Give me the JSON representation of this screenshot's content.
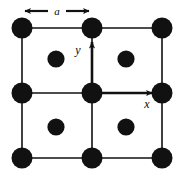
{
  "figure": {
    "name": "square-lattice-unit-cells",
    "background_color": "#ffffff",
    "ink_color": "#111111",
    "atom_color": "#111111"
  },
  "labels": {
    "lattice_constant": "a",
    "x_axis": "x",
    "y_axis": "y"
  },
  "diagram_data": {
    "type": "lattice-diagram",
    "description": "Two-dimensional square lattice drawn as a 2x2 array of unit cells, with large lattice-point atoms at every cell corner and smaller atoms at every cell center; Cartesian x and y axes originate at the central lattice point.",
    "lattice_constant_label": "a",
    "grid_columns": 3,
    "grid_rows": 3,
    "cell_size_px": 70,
    "corner_atom_radius_px": 10.5,
    "center_atom_radius_px": 8.5,
    "corner_atoms": [
      {
        "id": "corner-0-0",
        "cx": 22,
        "cy": 28
      },
      {
        "id": "corner-1-0",
        "cx": 92,
        "cy": 28
      },
      {
        "id": "corner-2-0",
        "cx": 162,
        "cy": 28
      },
      {
        "id": "corner-0-1",
        "cx": 22,
        "cy": 93
      },
      {
        "id": "corner-1-1",
        "cx": 92,
        "cy": 93
      },
      {
        "id": "corner-2-1",
        "cx": 162,
        "cy": 93
      },
      {
        "id": "corner-0-2",
        "cx": 22,
        "cy": 158
      },
      {
        "id": "corner-1-2",
        "cx": 92,
        "cy": 158
      },
      {
        "id": "corner-2-2",
        "cx": 162,
        "cy": 158
      }
    ],
    "center_atoms": [
      {
        "id": "center-top-left",
        "cx": 56,
        "cy": 59
      },
      {
        "id": "center-top-right",
        "cx": 126,
        "cy": 59
      },
      {
        "id": "center-bottom-left",
        "cx": 56,
        "cy": 127
      },
      {
        "id": "center-bottom-right",
        "cx": 126,
        "cy": 127
      }
    ],
    "grid_lines": {
      "vertical_x": [
        22,
        92,
        162
      ],
      "horizontal_y": [
        28,
        93,
        158
      ],
      "line_width_px": 1.6
    },
    "axes": {
      "origin": {
        "x": 92,
        "y": 93
      },
      "x_arrow_end": {
        "x": 158,
        "y": 93
      },
      "y_arrow_end": {
        "x": 92,
        "y": 36
      },
      "x_label_pos": {
        "x": 146,
        "y": 107
      },
      "y_label_pos": {
        "x": 78,
        "y": 53
      }
    },
    "dimension_arrow": {
      "label": "a",
      "y": 11,
      "left_end": 20,
      "right_end": 93,
      "label_pos": {
        "x": 56,
        "y": 15
      }
    }
  }
}
